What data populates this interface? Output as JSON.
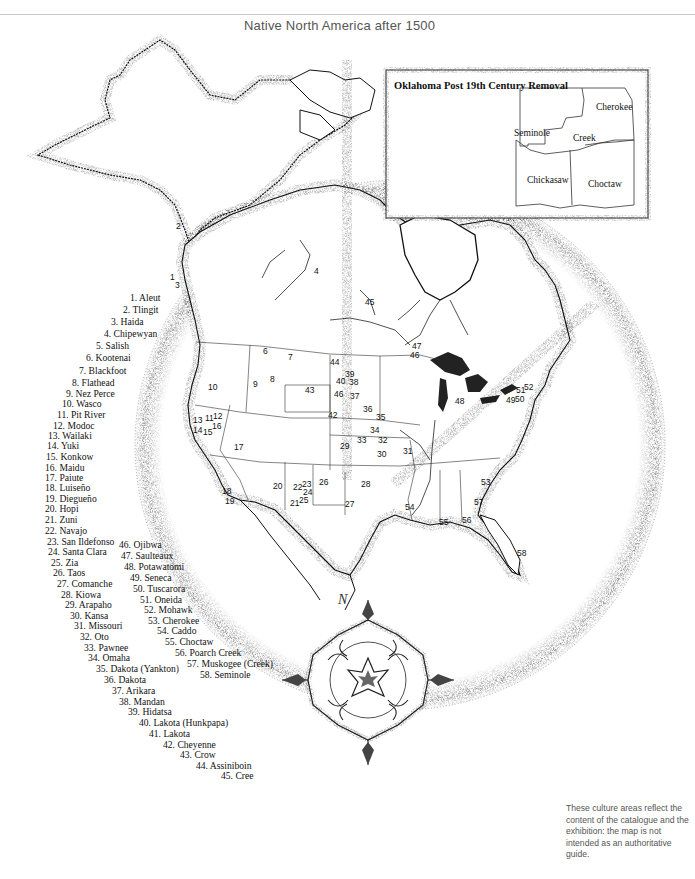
{
  "title": "Native North America after 1500",
  "inset": {
    "title": "Oklahoma Post 19th Century Removal",
    "regions": [
      {
        "label": "Cherokee",
        "x": 596,
        "y": 102
      },
      {
        "label": "Seminole",
        "x": 514,
        "y": 128
      },
      {
        "label": "Creek",
        "x": 573,
        "y": 133
      },
      {
        "label": "Chickasaw",
        "x": 527,
        "y": 175
      },
      {
        "label": "Choctaw",
        "x": 588,
        "y": 179
      }
    ]
  },
  "legend": [
    {
      "n": 1,
      "label": "1. Aleut",
      "x": 130,
      "y": 293
    },
    {
      "n": 2,
      "label": "2. Tlingit",
      "x": 123,
      "y": 305
    },
    {
      "n": 3,
      "label": "3. Haida",
      "x": 111,
      "y": 317
    },
    {
      "n": 4,
      "label": "4. Chipewyan",
      "x": 104,
      "y": 329
    },
    {
      "n": 5,
      "label": "5. Salish",
      "x": 96,
      "y": 341
    },
    {
      "n": 6,
      "label": "6. Kootenai",
      "x": 86,
      "y": 353
    },
    {
      "n": 7,
      "label": "7. Blackfoot",
      "x": 79,
      "y": 366
    },
    {
      "n": 8,
      "label": "8. Flathead",
      "x": 72,
      "y": 378
    },
    {
      "n": 9,
      "label": "9. Nez Perce",
      "x": 66,
      "y": 389
    },
    {
      "n": 10,
      "label": "10. Wasco",
      "x": 62,
      "y": 399
    },
    {
      "n": 11,
      "label": "11. Pit River",
      "x": 57,
      "y": 410
    },
    {
      "n": 12,
      "label": "12. Modoc",
      "x": 53,
      "y": 421
    },
    {
      "n": 13,
      "label": "13. Wailaki",
      "x": 48,
      "y": 431
    },
    {
      "n": 14,
      "label": "14. Yuki",
      "x": 47,
      "y": 441
    },
    {
      "n": 15,
      "label": "15. Konkow",
      "x": 46,
      "y": 452
    },
    {
      "n": 16,
      "label": "16. Maidu",
      "x": 45,
      "y": 463
    },
    {
      "n": 17,
      "label": "17. Paiute",
      "x": 45,
      "y": 473
    },
    {
      "n": 18,
      "label": "18. Luiseño",
      "x": 45,
      "y": 483
    },
    {
      "n": 19,
      "label": "19. Diegueño",
      "x": 45,
      "y": 494
    },
    {
      "n": 20,
      "label": "20. Hopi",
      "x": 45,
      "y": 504
    },
    {
      "n": 21,
      "label": "21. Zuni",
      "x": 45,
      "y": 515
    },
    {
      "n": 22,
      "label": "22. Navajo",
      "x": 45,
      "y": 526
    },
    {
      "n": 23,
      "label": "23. San Ildefonso",
      "x": 47,
      "y": 537
    },
    {
      "n": 24,
      "label": "24. Santa Clara",
      "x": 48,
      "y": 547
    },
    {
      "n": 25,
      "label": "25. Zia",
      "x": 51,
      "y": 558
    },
    {
      "n": 26,
      "label": "26. Taos",
      "x": 53,
      "y": 568
    },
    {
      "n": 27,
      "label": "27. Comanche",
      "x": 57,
      "y": 579
    },
    {
      "n": 28,
      "label": "28. Kiowa",
      "x": 61,
      "y": 590
    },
    {
      "n": 29,
      "label": "29. Arapaho",
      "x": 65,
      "y": 600
    },
    {
      "n": 30,
      "label": "30. Kansa",
      "x": 70,
      "y": 611
    },
    {
      "n": 31,
      "label": "31. Missouri",
      "x": 74,
      "y": 621
    },
    {
      "n": 32,
      "label": "32. Oto",
      "x": 80,
      "y": 632
    },
    {
      "n": 33,
      "label": "33. Pawnee",
      "x": 84,
      "y": 643
    },
    {
      "n": 34,
      "label": "34. Omaha",
      "x": 88,
      "y": 653
    },
    {
      "n": 35,
      "label": "35. Dakota (Yankton)",
      "x": 96,
      "y": 664
    },
    {
      "n": 36,
      "label": "36. Dakota",
      "x": 104,
      "y": 675
    },
    {
      "n": 37,
      "label": "37. Arikara",
      "x": 112,
      "y": 686
    },
    {
      "n": 38,
      "label": "38. Mandan",
      "x": 119,
      "y": 697
    },
    {
      "n": 39,
      "label": "39. Hidatsa",
      "x": 128,
      "y": 707
    },
    {
      "n": 40,
      "label": "40. Lakota (Hunkpapa)",
      "x": 139,
      "y": 718
    },
    {
      "n": 41,
      "label": "41. Lakota",
      "x": 149,
      "y": 729
    },
    {
      "n": 42,
      "label": "42. Cheyenne",
      "x": 163,
      "y": 740
    },
    {
      "n": 43,
      "label": "43. Crow",
      "x": 180,
      "y": 750
    },
    {
      "n": 44,
      "label": "44. Assiniboin",
      "x": 196,
      "y": 761
    },
    {
      "n": 45,
      "label": "45. Cree",
      "x": 221,
      "y": 771
    },
    {
      "n": 46,
      "label": "46. Ojibwa",
      "x": 119,
      "y": 540
    },
    {
      "n": 47,
      "label": "47. Saulteaux",
      "x": 121,
      "y": 551
    },
    {
      "n": 48,
      "label": "48. Potawatomi",
      "x": 124,
      "y": 562
    },
    {
      "n": 49,
      "label": "49. Seneca",
      "x": 130,
      "y": 573
    },
    {
      "n": 50,
      "label": "50. Tuscarora",
      "x": 133,
      "y": 584
    },
    {
      "n": 51,
      "label": "51. Oneida",
      "x": 140,
      "y": 595
    },
    {
      "n": 52,
      "label": "52. Mohawk",
      "x": 144,
      "y": 605
    },
    {
      "n": 53,
      "label": "53. Cherokee",
      "x": 148,
      "y": 616
    },
    {
      "n": 54,
      "label": "54. Caddo",
      "x": 157,
      "y": 626
    },
    {
      "n": 55,
      "label": "55. Choctaw",
      "x": 165,
      "y": 637
    },
    {
      "n": 56,
      "label": "56. Poarch Creek",
      "x": 175,
      "y": 648
    },
    {
      "n": 57,
      "label": "57. Muskogee (Creek)",
      "x": 187,
      "y": 659
    },
    {
      "n": 58,
      "label": "58. Seminole",
      "x": 200,
      "y": 670
    }
  ],
  "map_numbers": [
    {
      "t": "1",
      "x": 170,
      "y": 273
    },
    {
      "t": "2",
      "x": 176,
      "y": 222
    },
    {
      "t": "3",
      "x": 175,
      "y": 281
    },
    {
      "t": "4",
      "x": 314,
      "y": 267
    },
    {
      "t": "45",
      "x": 365,
      "y": 298
    },
    {
      "t": "6",
      "x": 263,
      "y": 347
    },
    {
      "t": "7",
      "x": 288,
      "y": 353
    },
    {
      "t": "44",
      "x": 330,
      "y": 358
    },
    {
      "t": "39",
      "x": 345,
      "y": 370
    },
    {
      "t": "40",
      "x": 336,
      "y": 377
    },
    {
      "t": "38",
      "x": 349,
      "y": 378
    },
    {
      "t": "10",
      "x": 208,
      "y": 383
    },
    {
      "t": "9",
      "x": 253,
      "y": 380
    },
    {
      "t": "8",
      "x": 270,
      "y": 375
    },
    {
      "t": "43",
      "x": 305,
      "y": 386
    },
    {
      "t": "46",
      "x": 334,
      "y": 390
    },
    {
      "t": "37",
      "x": 350,
      "y": 392
    },
    {
      "t": "36",
      "x": 363,
      "y": 405
    },
    {
      "t": "42",
      "x": 328,
      "y": 411
    },
    {
      "t": "35",
      "x": 376,
      "y": 413
    },
    {
      "t": "13",
      "x": 193,
      "y": 416
    },
    {
      "t": "11",
      "x": 205,
      "y": 414
    },
    {
      "t": "12",
      "x": 213,
      "y": 412
    },
    {
      "t": "14",
      "x": 193,
      "y": 426
    },
    {
      "t": "15",
      "x": 203,
      "y": 428
    },
    {
      "t": "16",
      "x": 212,
      "y": 422
    },
    {
      "t": "17",
      "x": 234,
      "y": 443
    },
    {
      "t": "34",
      "x": 370,
      "y": 426
    },
    {
      "t": "33",
      "x": 357,
      "y": 436
    },
    {
      "t": "32",
      "x": 378,
      "y": 436
    },
    {
      "t": "29",
      "x": 340,
      "y": 442
    },
    {
      "t": "30",
      "x": 377,
      "y": 450
    },
    {
      "t": "31",
      "x": 403,
      "y": 447
    },
    {
      "t": "47",
      "x": 412,
      "y": 342
    },
    {
      "t": "46",
      "x": 410,
      "y": 351
    },
    {
      "t": "48",
      "x": 455,
      "y": 397
    },
    {
      "t": "51",
      "x": 516,
      "y": 386
    },
    {
      "t": "52",
      "x": 524,
      "y": 383
    },
    {
      "t": "49",
      "x": 506,
      "y": 396
    },
    {
      "t": "50",
      "x": 515,
      "y": 395
    },
    {
      "t": "20",
      "x": 273,
      "y": 482
    },
    {
      "t": "22",
      "x": 293,
      "y": 483
    },
    {
      "t": "23",
      "x": 302,
      "y": 480
    },
    {
      "t": "24",
      "x": 303,
      "y": 488
    },
    {
      "t": "25",
      "x": 299,
      "y": 496
    },
    {
      "t": "21",
      "x": 290,
      "y": 499
    },
    {
      "t": "26",
      "x": 319,
      "y": 478
    },
    {
      "t": "28",
      "x": 361,
      "y": 480
    },
    {
      "t": "27",
      "x": 345,
      "y": 500
    },
    {
      "t": "53",
      "x": 481,
      "y": 478
    },
    {
      "t": "54",
      "x": 405,
      "y": 503
    },
    {
      "t": "57",
      "x": 474,
      "y": 498
    },
    {
      "t": "55",
      "x": 439,
      "y": 518
    },
    {
      "t": "56",
      "x": 462,
      "y": 516
    },
    {
      "t": "58",
      "x": 517,
      "y": 549
    },
    {
      "t": "18",
      "x": 222,
      "y": 487
    },
    {
      "t": "19",
      "x": 225,
      "y": 497
    }
  ],
  "compass": {
    "north_label": "N"
  },
  "caption": "These culture areas reflect the content of the catalogue and the exhibition: the map is not intended as an authoritative guide.",
  "colors": {
    "ink": "#111111",
    "stipple": "#9a9a9a",
    "paper": "#ffffff",
    "caption": "#555555"
  }
}
